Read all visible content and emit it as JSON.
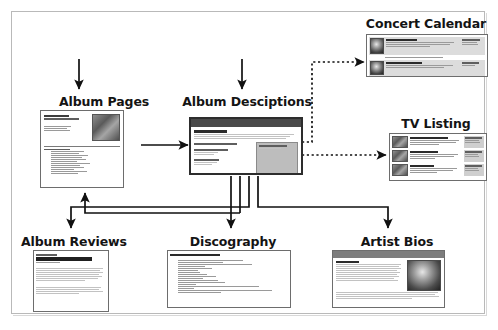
{
  "diagram": {
    "nodes": [
      {
        "id": "album-pages",
        "label": "Album Pages",
        "x": 50,
        "y": 96
      },
      {
        "id": "album-descriptions",
        "label": "Album Desciptions",
        "x": 192,
        "y": 96
      },
      {
        "id": "concert-calendar",
        "label": "Concert Calendar",
        "x": 373,
        "y": 18
      },
      {
        "id": "tv-listing",
        "label": "TV Listing",
        "x": 398,
        "y": 118
      },
      {
        "id": "album-reviews",
        "label": "Album Reviews",
        "x": 31,
        "y": 236
      },
      {
        "id": "discography",
        "label": "Discography",
        "x": 185,
        "y": 236
      },
      {
        "id": "artist-bios",
        "label": "Artist Bios",
        "x": 356,
        "y": 236
      }
    ],
    "edges": [
      {
        "from": "above",
        "to": "album-pages",
        "style": "solid",
        "direction": "down"
      },
      {
        "from": "above",
        "to": "album-descriptions",
        "style": "solid",
        "direction": "down"
      },
      {
        "from": "album-pages",
        "to": "album-descriptions",
        "style": "solid",
        "direction": "right"
      },
      {
        "from": "album-descriptions",
        "to": "concert-calendar",
        "style": "dotted",
        "direction": "right"
      },
      {
        "from": "album-descriptions",
        "to": "tv-listing",
        "style": "dotted",
        "direction": "right"
      },
      {
        "from": "album-descriptions",
        "to": "discography",
        "style": "solid",
        "direction": "down"
      },
      {
        "from": "album-descriptions",
        "to": "artist-bios",
        "style": "solid",
        "direction": "down"
      },
      {
        "from": "album-descriptions",
        "to": "album-reviews",
        "style": "solid",
        "direction": "down"
      },
      {
        "from": "album-reviews",
        "to": "album-pages",
        "style": "solid",
        "direction": "up"
      },
      {
        "from": "discography",
        "to": "album-pages",
        "style": "solid",
        "direction": "up"
      }
    ]
  },
  "thumbnails": {
    "album_pages": {
      "name": "album-pages-thumbnail",
      "header_small": "Radiohead",
      "header_title": "Hail To The Thief",
      "section_label": "Track Listing"
    },
    "album_descriptions": {
      "name": "album-descriptions-thumbnail",
      "header_title": "Radiohead",
      "item_1": "Hail To The Thief (Limited Edition)",
      "item_2": "Amnesiac (Limited)",
      "item_3": "Kid A"
    },
    "concert_calendar": {
      "name": "concert-calendar-thumbnail",
      "row_1_title": "Hail To The Thief",
      "row_1_meta": "Local Date",
      "row_2_title": "Amnesiac Wednesday",
      "row_2_meta": "Tip Date"
    },
    "tv_listing": {
      "name": "tv-listing-thumbnail",
      "row_1_title": "Thom Yorke on Evening Sessions",
      "row_2_title": "Meeting People Is Easy",
      "row_3_title": "Coldplay Live",
      "row_1_meta": "Saturday 10pm",
      "row_2_meta": "Sunday 9pm",
      "row_3_meta": "Monday 11pm"
    },
    "album_reviews": {
      "name": "album-reviews-thumbnail",
      "header_small": "Radiohead",
      "header_title": "Hail To The Thief",
      "subtitle": "(Parlophone)"
    },
    "discography": {
      "name": "discography-thumbnail",
      "header_title": "Radiohead - full album listing"
    },
    "artist_bios": {
      "name": "artist-bios-thumbnail",
      "header_title": "Radiohead"
    }
  },
  "colors": {
    "frame_border": "#b9b9b9",
    "arrow": "#111111",
    "thumb_border": "#6d6d6d",
    "thumb_titlebar": "#4a4a4a",
    "label_text": "#141414",
    "page_background": "#ffffff"
  }
}
